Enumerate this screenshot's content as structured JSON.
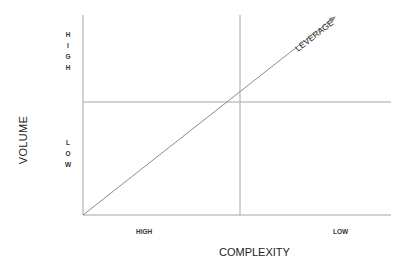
{
  "diagram": {
    "y_axis": {
      "title": "VOLUME",
      "high_label": "HIGH",
      "low_label": "LOW"
    },
    "x_axis": {
      "title": "COMPLEXITY",
      "left_label": "HIGH",
      "right_label": "LOW"
    },
    "diagonal_label": "LEVERAGE",
    "colors": {
      "line": "#a6a6a6",
      "arrow": "#8c8c8c",
      "text": "#222222"
    }
  }
}
